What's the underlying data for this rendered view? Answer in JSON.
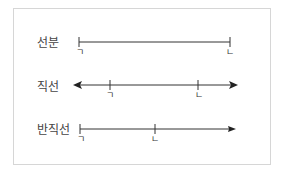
{
  "rows": [
    {
      "label": "선분",
      "type": "segment",
      "points": [
        "ㄱ",
        "ㄴ"
      ]
    },
    {
      "label": "직선",
      "type": "line",
      "points": [
        "ㄱ",
        "ㄴ"
      ]
    },
    {
      "label": "반직선",
      "type": "ray",
      "points": [
        "ㄱ",
        "ㄴ"
      ]
    }
  ],
  "colors": {
    "line": "#333333",
    "border": "#d6d6d6",
    "label": "#444444"
  }
}
